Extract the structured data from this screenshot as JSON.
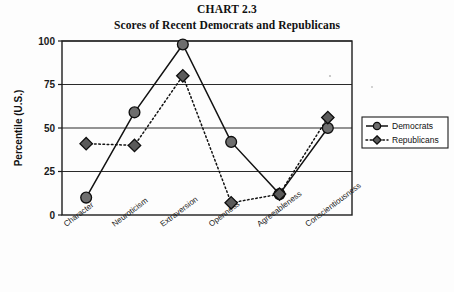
{
  "chart_data": {
    "type": "line",
    "title": "CHART 2.3",
    "subtitle": "Scores of Recent Democrats and Republicans",
    "xlabel": "",
    "ylabel": "Percentile (U.S.)",
    "categories": [
      "Character",
      "Neuroticism",
      "Extraversion",
      "Openness",
      "Agreeableness",
      "Conscientiousness"
    ],
    "ylim": [
      0,
      100
    ],
    "yticks": [
      0,
      25,
      50,
      75,
      100
    ],
    "ytick_labels": [
      "0",
      "25",
      "50",
      "75",
      "100"
    ],
    "grid": true,
    "legend_position": "right",
    "series": [
      {
        "name": "Democrats",
        "marker": "circle",
        "line_style": "solid",
        "values": [
          10,
          59,
          98,
          42,
          12,
          50
        ]
      },
      {
        "name": "Republicans",
        "marker": "diamond",
        "line_style": "dotted",
        "values": [
          41,
          40,
          80,
          7,
          12,
          56
        ]
      }
    ]
  },
  "legend": {
    "entries": [
      {
        "label": "Democrats"
      },
      {
        "label": "Republicans"
      }
    ]
  },
  "colors": {
    "axis": "#1d1d1d",
    "grid": "#2a2a2a",
    "line": "#121212",
    "marker_fill": "#6e6e6e",
    "background": "#fdfdfd"
  }
}
